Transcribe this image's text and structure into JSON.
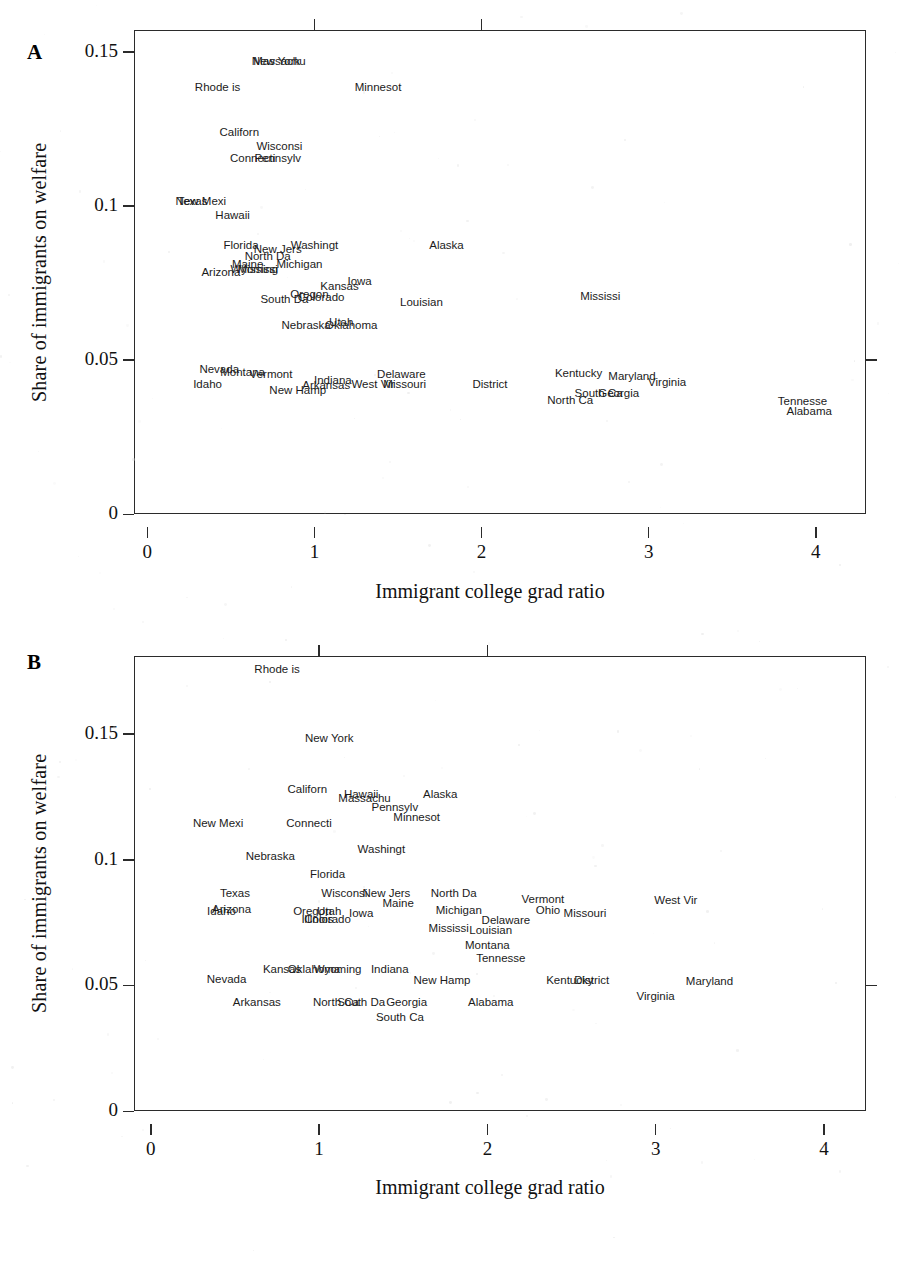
{
  "figure": {
    "panels": [
      {
        "letter": "A",
        "xlabel": "Immigrant college grad ratio",
        "ylabel": "Share of immigrants on welfare",
        "xticks": [
          "0",
          "1",
          "2",
          "3",
          "4"
        ],
        "yticks": [
          "0.15",
          "0.1",
          "0.05",
          "0"
        ]
      },
      {
        "letter": "B",
        "xlabel": "Immigrant college grad ratio",
        "ylabel": "Share of immigrants on welfare",
        "xticks": [
          "0",
          "1",
          "2",
          "3",
          "4"
        ],
        "yticks": [
          "0.15",
          "0.1",
          "0.05",
          "0"
        ]
      }
    ]
  },
  "chart_data": [
    {
      "type": "scatter",
      "panel": "A",
      "title": "",
      "xlabel": "Immigrant college grad ratio",
      "ylabel": "Share of immigrants on welfare",
      "xlim": [
        -0.08,
        4.3
      ],
      "ylim": [
        0,
        0.157
      ],
      "xticks": [
        0,
        1,
        2,
        3,
        4
      ],
      "yticks": [
        0,
        0.05,
        0.1,
        0.15
      ],
      "grid": false,
      "legend": null,
      "point_style": "text-labels-only",
      "labels": [
        "state name abbreviated to 8 characters"
      ],
      "points": [
        {
          "label": "Massachu",
          "x": 0.79,
          "y": 0.1465
        },
        {
          "label": "New York",
          "x": 0.77,
          "y": 0.1465
        },
        {
          "label": "Rhode is",
          "x": 0.42,
          "y": 0.1382
        },
        {
          "label": "Minnesot",
          "x": 1.38,
          "y": 0.1382
        },
        {
          "label": "Californ",
          "x": 0.55,
          "y": 0.1235
        },
        {
          "label": "Wisconsi",
          "x": 0.79,
          "y": 0.119
        },
        {
          "label": "Connecti",
          "x": 0.63,
          "y": 0.1152
        },
        {
          "label": "Pennsylv",
          "x": 0.78,
          "y": 0.1152
        },
        {
          "label": "New Mexi",
          "x": 0.32,
          "y": 0.1013
        },
        {
          "label": "Texas",
          "x": 0.27,
          "y": 0.1013
        },
        {
          "label": "Hawaii",
          "x": 0.51,
          "y": 0.0968
        },
        {
          "label": "Florida",
          "x": 0.56,
          "y": 0.0869
        },
        {
          "label": "New Jers",
          "x": 0.78,
          "y": 0.0855
        },
        {
          "label": "Washingt",
          "x": 1.0,
          "y": 0.0869
        },
        {
          "label": "Alaska",
          "x": 1.79,
          "y": 0.0869
        },
        {
          "label": "North Da",
          "x": 0.72,
          "y": 0.0833
        },
        {
          "label": "Maine",
          "x": 0.6,
          "y": 0.0808
        },
        {
          "label": "Michigan",
          "x": 0.91,
          "y": 0.0808
        },
        {
          "label": "Wyoming",
          "x": 0.64,
          "y": 0.079
        },
        {
          "label": "Mississi",
          "x": 0.66,
          "y": 0.079
        },
        {
          "label": "Arizona",
          "x": 0.44,
          "y": 0.0783
        },
        {
          "label": "Iowa",
          "x": 1.27,
          "y": 0.0753
        },
        {
          "label": "Kansas",
          "x": 1.15,
          "y": 0.0735
        },
        {
          "label": "Oregon",
          "x": 0.97,
          "y": 0.0712
        },
        {
          "label": "Colorado",
          "x": 1.04,
          "y": 0.07
        },
        {
          "label": "South Da",
          "x": 0.82,
          "y": 0.0695
        },
        {
          "label": "Louisian",
          "x": 1.64,
          "y": 0.0685
        },
        {
          "label": "Mississi",
          "x": 2.71,
          "y": 0.0703
        },
        {
          "label": "Nebraska",
          "x": 0.95,
          "y": 0.061
        },
        {
          "label": "Utah",
          "x": 1.16,
          "y": 0.0618
        },
        {
          "label": "Oklahoma",
          "x": 1.22,
          "y": 0.061
        },
        {
          "label": "Nevada",
          "x": 0.43,
          "y": 0.0466
        },
        {
          "label": "Montana",
          "x": 0.57,
          "y": 0.0458
        },
        {
          "label": "Vermont",
          "x": 0.74,
          "y": 0.045
        },
        {
          "label": "Idaho",
          "x": 0.36,
          "y": 0.042
        },
        {
          "label": "Indiana",
          "x": 1.11,
          "y": 0.0432
        },
        {
          "label": "Arkansas",
          "x": 1.07,
          "y": 0.0415
        },
        {
          "label": "West Vir",
          "x": 1.35,
          "y": 0.0418
        },
        {
          "label": "Missouri",
          "x": 1.54,
          "y": 0.0418
        },
        {
          "label": "Delaware",
          "x": 1.52,
          "y": 0.0452
        },
        {
          "label": "New Hamp",
          "x": 0.9,
          "y": 0.04
        },
        {
          "label": "District",
          "x": 2.05,
          "y": 0.0418
        },
        {
          "label": "Kentucky",
          "x": 2.58,
          "y": 0.0455
        },
        {
          "label": "Maryland",
          "x": 2.9,
          "y": 0.0445
        },
        {
          "label": "Virginia",
          "x": 3.11,
          "y": 0.0425
        },
        {
          "label": "South Ca",
          "x": 2.7,
          "y": 0.0388
        },
        {
          "label": "Georgia",
          "x": 2.82,
          "y": 0.0388
        },
        {
          "label": "North Ca",
          "x": 2.53,
          "y": 0.0365
        },
        {
          "label": "Tennesse",
          "x": 3.92,
          "y": 0.0363
        },
        {
          "label": "Alabama",
          "x": 3.96,
          "y": 0.033
        }
      ]
    },
    {
      "type": "scatter",
      "panel": "B",
      "title": "",
      "xlabel": "Immigrant college grad ratio",
      "ylabel": "Share of immigrants on welfare",
      "xlim": [
        -0.1,
        4.25
      ],
      "ylim": [
        0,
        0.181
      ],
      "xticks": [
        0,
        1,
        2,
        3,
        4
      ],
      "yticks": [
        0,
        0.05,
        0.1,
        0.15
      ],
      "grid": false,
      "legend": null,
      "point_style": "text-labels-only",
      "points": [
        {
          "label": "Rhode is",
          "x": 0.75,
          "y": 0.1755
        },
        {
          "label": "New York",
          "x": 1.06,
          "y": 0.1478
        },
        {
          "label": "Californ",
          "x": 0.93,
          "y": 0.1278
        },
        {
          "label": "Hawaii",
          "x": 1.25,
          "y": 0.1258
        },
        {
          "label": "Massachu",
          "x": 1.27,
          "y": 0.124
        },
        {
          "label": "Alaska",
          "x": 1.72,
          "y": 0.1258
        },
        {
          "label": "Pennsylv",
          "x": 1.45,
          "y": 0.1205
        },
        {
          "label": "Minnesot",
          "x": 1.58,
          "y": 0.1165
        },
        {
          "label": "New Mexi",
          "x": 0.4,
          "y": 0.1142
        },
        {
          "label": "Connecti",
          "x": 0.94,
          "y": 0.1142
        },
        {
          "label": "Washingt",
          "x": 1.37,
          "y": 0.104
        },
        {
          "label": "Nebraska",
          "x": 0.71,
          "y": 0.1012
        },
        {
          "label": "Florida",
          "x": 1.05,
          "y": 0.094
        },
        {
          "label": "Texas",
          "x": 0.5,
          "y": 0.0862
        },
        {
          "label": "Wisconsi",
          "x": 1.15,
          "y": 0.0862
        },
        {
          "label": "New Jers",
          "x": 1.4,
          "y": 0.0862
        },
        {
          "label": "North Da",
          "x": 1.8,
          "y": 0.0862
        },
        {
          "label": "Vermont",
          "x": 2.33,
          "y": 0.084
        },
        {
          "label": "West Vir",
          "x": 3.12,
          "y": 0.0835
        },
        {
          "label": "Maine",
          "x": 1.47,
          "y": 0.0822
        },
        {
          "label": "Arizona",
          "x": 0.48,
          "y": 0.08
        },
        {
          "label": "Idaho",
          "x": 0.42,
          "y": 0.079
        },
        {
          "label": "Michigan",
          "x": 1.83,
          "y": 0.0795
        },
        {
          "label": "Ohio",
          "x": 2.36,
          "y": 0.0795
        },
        {
          "label": "Missouri",
          "x": 2.58,
          "y": 0.0785
        },
        {
          "label": "Oregon",
          "x": 0.96,
          "y": 0.079
        },
        {
          "label": "Utah",
          "x": 1.06,
          "y": 0.079
        },
        {
          "label": "Iowa",
          "x": 1.25,
          "y": 0.0785
        },
        {
          "label": "Illinois",
          "x": 0.99,
          "y": 0.076
        },
        {
          "label": "Colorado",
          "x": 1.05,
          "y": 0.0758
        },
        {
          "label": "Delaware",
          "x": 2.11,
          "y": 0.0755
        },
        {
          "label": "Mississi",
          "x": 1.77,
          "y": 0.0725
        },
        {
          "label": "Louisian",
          "x": 2.02,
          "y": 0.0718
        },
        {
          "label": "Montana",
          "x": 2.0,
          "y": 0.0658
        },
        {
          "label": "Kansas",
          "x": 0.78,
          "y": 0.056
        },
        {
          "label": "Oklahoma",
          "x": 0.97,
          "y": 0.056
        },
        {
          "label": "Wyoming",
          "x": 1.11,
          "y": 0.056
        },
        {
          "label": "Indiana",
          "x": 1.42,
          "y": 0.056
        },
        {
          "label": "Tennesse",
          "x": 2.08,
          "y": 0.0605
        },
        {
          "label": "Nevada",
          "x": 0.45,
          "y": 0.052
        },
        {
          "label": "New Hamp",
          "x": 1.73,
          "y": 0.0518
        },
        {
          "label": "Kentucky",
          "x": 2.49,
          "y": 0.0518
        },
        {
          "label": "District",
          "x": 2.62,
          "y": 0.0518
        },
        {
          "label": "Maryland",
          "x": 3.32,
          "y": 0.0512
        },
        {
          "label": "Arkansas",
          "x": 0.63,
          "y": 0.043
        },
        {
          "label": "North Ca",
          "x": 1.1,
          "y": 0.043
        },
        {
          "label": "South Da",
          "x": 1.25,
          "y": 0.043
        },
        {
          "label": "Georgia",
          "x": 1.52,
          "y": 0.043
        },
        {
          "label": "Alabama",
          "x": 2.02,
          "y": 0.043
        },
        {
          "label": "Virginia",
          "x": 3.0,
          "y": 0.0452
        },
        {
          "label": "South Ca",
          "x": 1.48,
          "y": 0.037
        }
      ]
    }
  ]
}
